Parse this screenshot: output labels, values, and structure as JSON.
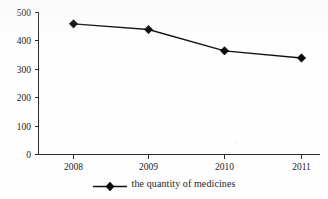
{
  "chart_data": {
    "type": "line",
    "title": "",
    "xlabel": "",
    "ylabel": "",
    "categories": [
      "2008",
      "2009",
      "2010",
      "2011"
    ],
    "series": [
      {
        "name": "the quantity of medicines",
        "values": [
          460,
          440,
          365,
          340
        ]
      }
    ],
    "ylim": [
      0,
      500
    ],
    "y_ticks": [
      0,
      100,
      200,
      300,
      400,
      500
    ],
    "y_tick_labels": [
      "0",
      "100",
      "200",
      "300",
      "400",
      "500"
    ],
    "x_tick_labels": [
      "2008",
      "2009",
      "2010",
      "2011"
    ],
    "grid": false,
    "legend_position": "bottom",
    "marker": "diamond",
    "line_color": "#111111",
    "marker_color": "#0a0a0a",
    "axis_color": "#2b2b2b"
  },
  "legend": {
    "entries": [
      {
        "label": "the quantity of medicines",
        "marker": "diamond-marker",
        "color": "#0a0a0a"
      }
    ]
  }
}
